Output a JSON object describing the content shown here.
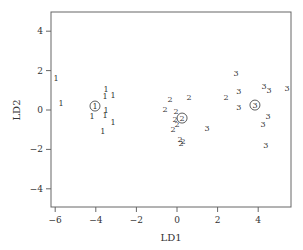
{
  "chart_data": {
    "type": "scatter",
    "title": "",
    "xlabel": "LD1",
    "ylabel": "LD2",
    "xlim": [
      -6.2,
      5.6
    ],
    "ylim": [
      -4.9,
      4.9
    ],
    "xticks": [
      -6,
      -4,
      -2,
      0,
      2,
      4
    ],
    "yticks": [
      -4,
      -2,
      0,
      2,
      4
    ],
    "grid": false,
    "legend": "none",
    "series": [
      {
        "name": "1",
        "marker": "1",
        "points": [
          [
            -5.96,
            1.62
          ],
          [
            -5.71,
            0.36
          ],
          [
            -3.5,
            1.07
          ],
          [
            -3.55,
            0.71
          ],
          [
            -3.15,
            0.76
          ],
          [
            -3.5,
            0.0
          ],
          [
            -4.19,
            -0.3
          ],
          [
            -3.55,
            -0.25
          ],
          [
            -3.15,
            -0.61
          ],
          [
            -3.65,
            -1.07
          ]
        ],
        "centroid": [
          -4.04,
          0.2
        ]
      },
      {
        "name": "2",
        "marker": "2",
        "points": [
          [
            0.59,
            0.66
          ],
          [
            -0.34,
            0.56
          ],
          [
            -0.59,
            0.05
          ],
          [
            -0.05,
            -0.05
          ],
          [
            -0.1,
            -0.46
          ],
          [
            0.0,
            -0.71
          ],
          [
            -0.2,
            -0.96
          ],
          [
            0.15,
            -1.47
          ],
          [
            0.3,
            -1.57
          ],
          [
            0.2,
            -1.68
          ],
          [
            2.41,
            0.66
          ]
        ],
        "centroid": [
          0.25,
          -0.41
        ]
      },
      {
        "name": "3",
        "marker": "3",
        "points": [
          [
            2.91,
            1.88
          ],
          [
            3.05,
            0.96
          ],
          [
            4.29,
            1.22
          ],
          [
            4.53,
            1.02
          ],
          [
            5.42,
            1.12
          ],
          [
            3.05,
            0.15
          ],
          [
            4.48,
            -0.3
          ],
          [
            4.24,
            -0.71
          ],
          [
            4.38,
            -1.78
          ],
          [
            1.48,
            -0.91
          ]
        ],
        "centroid": [
          3.84,
          0.25
        ]
      }
    ]
  },
  "axes": {
    "x_title": "LD1",
    "y_title": "LD2"
  }
}
